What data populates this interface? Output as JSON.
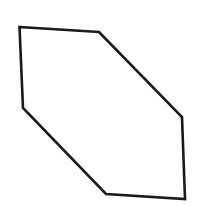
{
  "diagram": {
    "shape": "hexagon",
    "background": "#ffffff",
    "stroke_color": "#1a1a1a",
    "stroke_width": 2.6,
    "fill": "none",
    "vertices": [
      [
        19.5,
        27
      ],
      [
        99,
        32
      ],
      [
        182,
        117
      ],
      [
        185,
        199
      ],
      [
        106,
        194
      ],
      [
        23,
        108
      ]
    ]
  }
}
